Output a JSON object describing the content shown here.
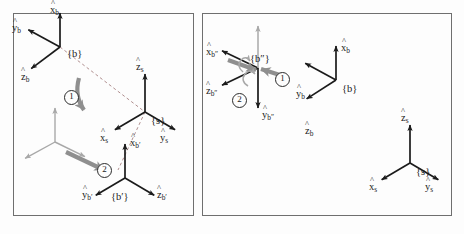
{
  "figure": {
    "panels": [
      {
        "id": "left",
        "caption": "Rotations about fixed space-frame axes",
        "frames": [
          {
            "name": "{b}",
            "label": "{b}",
            "origin": [
              60,
              47
            ],
            "color": "#1b1b1b",
            "axes": [
              {
                "label": "x",
                "sub": "b",
                "dir": [
                  0,
                  -1
                ],
                "len": 34,
                "lx": 50,
                "ly": 5
              },
              {
                "label": "y",
                "sub": "b",
                "dir": [
                  -0.88,
                  -0.48
                ],
                "len": 36,
                "lx": 12,
                "ly": 23
              },
              {
                "label": "z",
                "sub": "b",
                "dir": [
                  -0.8,
                  0.6
                ],
                "len": 36,
                "lx": 21,
                "ly": 72
              }
            ]
          },
          {
            "name": "{s}",
            "label": "{s}",
            "origin": [
              145,
              112
            ],
            "color": "#1b1b1b",
            "axes": [
              {
                "label": "z",
                "sub": "s",
                "dir": [
                  0,
                  -1
                ],
                "len": 38,
                "lx": 136,
                "ly": 62
              },
              {
                "label": "x",
                "sub": "s",
                "dir": [
                  -0.86,
                  0.51
                ],
                "len": 35,
                "lx": 100,
                "ly": 133
              },
              {
                "label": "y",
                "sub": "s",
                "dir": [
                  0.86,
                  0.51
                ],
                "len": 35,
                "lx": 160,
                "ly": 133
              }
            ]
          },
          {
            "name": "{ghost}",
            "label": "",
            "origin": [
              55,
              142
            ],
            "color": "#a8a8a8",
            "axes": [
              {
                "label": "",
                "sub": "",
                "dir": [
                  0,
                  -1
                ],
                "len": 34,
                "lx": 0,
                "ly": 0
              },
              {
                "label": "",
                "sub": "",
                "dir": [
                  -0.88,
                  0.48
                ],
                "len": 34,
                "lx": 0,
                "ly": 0
              },
              {
                "label": "",
                "sub": "",
                "dir": [
                  0.88,
                  0.43
                ],
                "len": 34,
                "lx": 0,
                "ly": 0
              }
            ]
          },
          {
            "name": "{b'}",
            "label": "{b′}",
            "origin": [
              125,
              178
            ],
            "color": "#1b1b1b",
            "axes": [
              {
                "label": "x",
                "sub": "b′",
                "dir": [
                  0,
                  -1
                ],
                "len": 34,
                "lx": 130,
                "ly": 138
              },
              {
                "label": "y",
                "sub": "b′",
                "dir": [
                  -0.86,
                  0.51
                ],
                "len": 34,
                "lx": 82,
                "ly": 190
              },
              {
                "label": "z",
                "sub": "b′",
                "dir": [
                  0.86,
                  0.51
                ],
                "len": 34,
                "lx": 157,
                "ly": 190
              }
            ]
          }
        ],
        "markers": [
          {
            "text": "1",
            "x": 64,
            "y": 90
          },
          {
            "text": "2",
            "x": 97,
            "y": 163
          }
        ],
        "dashed": true
      },
      {
        "id": "right",
        "caption": "Rotations about moving body-frame axes",
        "frames": [
          {
            "name": "{b''}",
            "label": "{b″}",
            "origin": [
              258,
              68
            ],
            "color": "#1b1b1b",
            "axes": [
              {
                "label": "x",
                "sub": "b″",
                "dir": [
                  -0.9,
                  -0.43
                ],
                "len": 40,
                "lx": 206,
                "ly": 47
              },
              {
                "label": "z",
                "sub": "b″",
                "dir": [
                  -0.9,
                  0.43
                ],
                "len": 40,
                "lx": 206,
                "ly": 86
              },
              {
                "label": "y",
                "sub": "b″",
                "dir": [
                  0,
                  1
                ],
                "len": 40,
                "lx": 262,
                "ly": 110
              }
            ]
          },
          {
            "name": "{b}",
            "label": "{b}",
            "origin": [
              336,
              80
            ],
            "color": "#1b1b1b",
            "axes": [
              {
                "label": "x",
                "sub": "b",
                "dir": [
                  0,
                  -1
                ],
                "len": 34,
                "lx": 341,
                "ly": 43
              },
              {
                "label": "y",
                "sub": "b",
                "dir": [
                  -0.88,
                  -0.48
                ],
                "len": 35,
                "lx": 296,
                "ly": 89
              },
              {
                "label": "z",
                "sub": "b",
                "dir": [
                  -0.84,
                  0.54
                ],
                "len": 35,
                "lx": 305,
                "ly": 126
              }
            ]
          },
          {
            "name": "{s}",
            "label": "{s}",
            "origin": [
              410,
              163
            ],
            "color": "#1b1b1b",
            "axes": [
              {
                "label": "z",
                "sub": "s",
                "dir": [
                  0,
                  -1
                ],
                "len": 38,
                "lx": 401,
                "ly": 113
              },
              {
                "label": "x",
                "sub": "s",
                "dir": [
                  -0.86,
                  0.51
                ],
                "len": 33,
                "lx": 369,
                "ly": 182
              },
              {
                "label": "y",
                "sub": "s",
                "dir": [
                  0.86,
                  0.51
                ],
                "len": 33,
                "lx": 425,
                "ly": 182
              }
            ]
          }
        ],
        "markers": [
          {
            "text": "1",
            "x": 275,
            "y": 72
          },
          {
            "text": "2",
            "x": 232,
            "y": 93
          }
        ],
        "dashed": false
      }
    ],
    "colors": {
      "axis": "#1b1b1b",
      "ghost": "#a8a8a8",
      "arrow_gray": "#8f8f8f",
      "border": "#6f6f6f",
      "background": "#fdfdfd"
    }
  }
}
